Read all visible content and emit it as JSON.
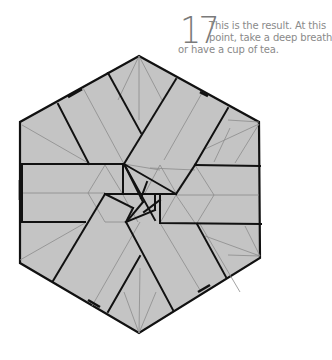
{
  "step": {
    "number": "17",
    "text_lines": [
      "This is the result. At this",
      "point, take a deep breath",
      "or have a cup of tea."
    ],
    "text": "This is the result. At this point, take a deep breath or have a cup of tea."
  },
  "diagram": {
    "shape": "hexagon",
    "colors": {
      "paper_fill": "#c4c4c4",
      "fold_edge": "#111111",
      "crease_line": "#8c8c8c",
      "text": "#888888",
      "step_number": "#7a7a7a"
    }
  }
}
